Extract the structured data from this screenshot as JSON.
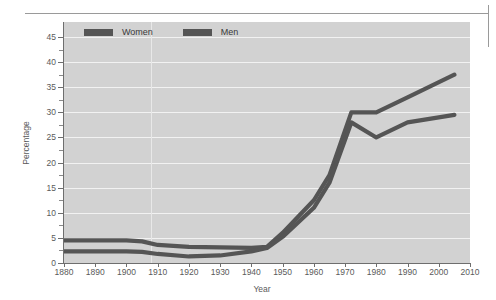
{
  "figure": {
    "plot_bg_color": "#d2d2d2",
    "gridline_color": "#f2f2f2",
    "axis_color": "#6e6e6e",
    "series_color": "#555555"
  },
  "legend": {
    "position": "top-left-inside",
    "entries": [
      {
        "label": "Women",
        "swatch_name": "legend-swatch-women",
        "color": "#555555"
      },
      {
        "label": "Men",
        "swatch_name": "legend-swatch-men",
        "color": "#555555"
      }
    ]
  },
  "axes": {
    "y_title": "Percentage",
    "x_title": "Year",
    "y_ticks": [
      "45",
      "40",
      "35",
      "30",
      "25",
      "20",
      "15",
      "10",
      "5",
      "0"
    ],
    "x_ticks": [
      "1880",
      "1890",
      "1900",
      "1910",
      "1920",
      "1930",
      "1940",
      "1950",
      "1960",
      "1970",
      "1980",
      "1990",
      "2000",
      "2010"
    ]
  },
  "chart_data": {
    "type": "line",
    "title": "",
    "xlabel": "Year",
    "ylabel": "Percentage",
    "xlim": [
      1880,
      2010
    ],
    "ylim": [
      0,
      48
    ],
    "ytick_values": [
      0,
      5,
      10,
      15,
      20,
      25,
      30,
      35,
      40,
      45
    ],
    "xtick_values": [
      1880,
      1890,
      1900,
      1910,
      1920,
      1930,
      1940,
      1950,
      1960,
      1970,
      1980,
      1990,
      2000,
      2010
    ],
    "grid": "horizontal-major-and-one-vertical-at-1908",
    "legend_position": "upper left inside axes",
    "series": [
      {
        "name": "Women",
        "color": "#555555",
        "x": [
          1880,
          1890,
          1900,
          1905,
          1910,
          1920,
          1930,
          1940,
          1945,
          1950,
          1960,
          1965,
          1972,
          1980,
          1990,
          2005
        ],
        "values": [
          4.5,
          4.5,
          4.5,
          4.3,
          3.6,
          3.2,
          3.1,
          3.0,
          3.2,
          6.0,
          12.5,
          17.5,
          30.0,
          30.0,
          33.0,
          37.5
        ]
      },
      {
        "name": "Men",
        "color": "#555555",
        "x": [
          1880,
          1890,
          1900,
          1905,
          1910,
          1920,
          1930,
          1940,
          1945,
          1950,
          1960,
          1965,
          1972,
          1980,
          1990,
          2005
        ],
        "values": [
          2.3,
          2.3,
          2.3,
          2.2,
          1.8,
          1.3,
          1.5,
          2.3,
          3.0,
          5.2,
          11.0,
          16.0,
          28.0,
          25.0,
          28.0,
          29.5
        ]
      }
    ]
  }
}
